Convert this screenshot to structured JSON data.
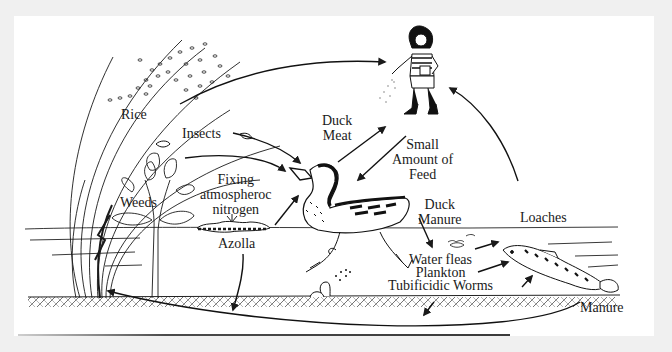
{
  "diagram": {
    "type": "ecological-cycle",
    "colors": {
      "background": "#f0f0f0",
      "panel": "#ffffff",
      "ink": "#1a1a1a"
    },
    "nodes": {
      "rice": {
        "label": "Rice"
      },
      "insects": {
        "label": "Insects"
      },
      "weeds": {
        "label": "Weeds"
      },
      "fixing": {
        "lines": [
          "Fixing",
          "atmospheroc",
          "nitrogen"
        ]
      },
      "azolla": {
        "label": "Azolla"
      },
      "duck_meat": {
        "lines": [
          "Duck",
          "Meat"
        ]
      },
      "small_feed": {
        "lines": [
          "Small",
          "Amount of",
          "Feed"
        ]
      },
      "duck_manure": {
        "lines": [
          "Duck",
          "Manure"
        ]
      },
      "loaches": {
        "label": "Loaches"
      },
      "water_fleas": {
        "lines": [
          "Water fleas",
          "Plankton",
          "Tubificidic Worms"
        ]
      },
      "manure": {
        "label": "Manure"
      }
    },
    "figures": [
      "rice-plant",
      "weed-plant",
      "azolla-mat",
      "duck",
      "farmer-child",
      "loach-fish",
      "worm",
      "insect"
    ],
    "edges": [
      {
        "from": "Rice",
        "to": "Farmer"
      },
      {
        "from": "Insects",
        "to": "Duck"
      },
      {
        "from": "Weeds",
        "to": "Duck"
      },
      {
        "from": "Azolla",
        "to": "Duck"
      },
      {
        "from": "Azolla",
        "to": "Soil"
      },
      {
        "from": "Duck",
        "to": "Farmer",
        "label": "Duck Meat"
      },
      {
        "from": "Farmer",
        "to": "Duck",
        "label": "Small Amount of Feed"
      },
      {
        "from": "Duck",
        "to": "Water fleas / Plankton / Tubificidic Worms",
        "label": "Duck Manure"
      },
      {
        "from": "Water fleas / Plankton / Tubificidic Worms",
        "to": "Loaches"
      },
      {
        "from": "Loaches",
        "to": "Farmer"
      },
      {
        "from": "Manure",
        "to": "Rice"
      },
      {
        "from": "Tubificidic Worms",
        "to": "Soil"
      }
    ]
  }
}
